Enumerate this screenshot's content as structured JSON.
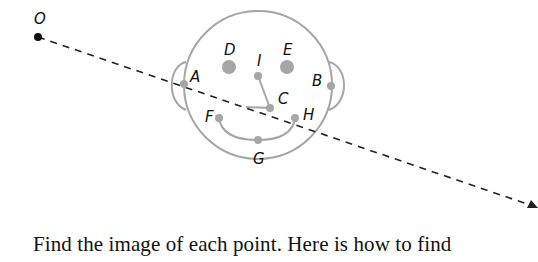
{
  "figure": {
    "center": {
      "label": "O",
      "x": 38,
      "y": 37
    },
    "ray_end": {
      "x": 535,
      "y": 207
    },
    "head": {
      "cx": 258,
      "cy": 85,
      "r": 74
    },
    "colors": {
      "face": "#a6a6a6",
      "ray": "#222222",
      "label": "#111111",
      "center_point": "#111111"
    },
    "points": [
      {
        "label": "A",
        "x": 184,
        "y": 84,
        "label_x": 190,
        "label_y": 82
      },
      {
        "label": "B",
        "x": 331,
        "y": 86,
        "label_x": 312,
        "label_y": 86
      },
      {
        "label": "C",
        "x": 270,
        "y": 108,
        "label_x": 278,
        "label_y": 104
      },
      {
        "label": "D",
        "x": 229,
        "y": 67,
        "label_x": 224,
        "label_y": 55
      },
      {
        "label": "E",
        "x": 287,
        "y": 67,
        "label_x": 283,
        "label_y": 55
      },
      {
        "label": "F",
        "x": 219,
        "y": 118,
        "label_x": 205,
        "label_y": 122
      },
      {
        "label": "G",
        "x": 258,
        "y": 140,
        "label_x": 253,
        "label_y": 164
      },
      {
        "label": "H",
        "x": 295,
        "y": 118,
        "label_x": 303,
        "label_y": 120
      },
      {
        "label": "I",
        "x": 258,
        "y": 76,
        "label_x": 257,
        "label_y": 66
      }
    ]
  },
  "caption": {
    "text": "Find the image of each point. Here is how to find"
  }
}
